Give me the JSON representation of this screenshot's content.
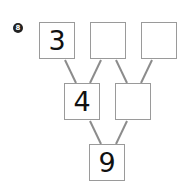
{
  "problem": {
    "number": "8",
    "top_row": [
      "3",
      "",
      ""
    ],
    "middle_row": [
      "4",
      ""
    ],
    "bottom_row": [
      "9"
    ]
  },
  "colors": {
    "line": "#8c8c8c",
    "border": "#9a9a9a",
    "text": "#111111"
  }
}
